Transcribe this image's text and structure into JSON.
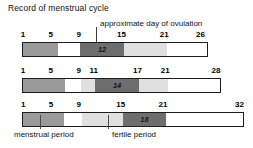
{
  "title": "Record of menstrual cycle",
  "callout": {
    "label": "approximate day of ovulation"
  },
  "legend": {
    "menstrual_label": "menstrual period",
    "fertile_label": "fertile period"
  },
  "colors": {
    "menstrual": "#9a9a9a",
    "fertile": "#6e6e6e",
    "light": "#e0e0e0",
    "white": "#ffffff",
    "outline": "#1d1d1d"
  },
  "rows": [
    {
      "cycle_length": 26,
      "ovulation_day": 12,
      "ticks": [
        {
          "label": "1",
          "pos": 0.5
        },
        {
          "label": "5",
          "pos": 15.5
        },
        {
          "label": "9",
          "pos": 30.5
        },
        {
          "label": "15",
          "pos": 53.5
        },
        {
          "label": "21",
          "pos": 76.5
        },
        {
          "label": "26",
          "pos": 96.0
        }
      ],
      "segments": [
        {
          "name": "menstrual",
          "start": 0.0,
          "end": 19.0
        },
        {
          "name": "white",
          "start": 19.0,
          "end": 31.0
        },
        {
          "name": "fertile",
          "start": 31.0,
          "end": 55.0
        },
        {
          "name": "light",
          "start": 55.0,
          "end": 78.0
        },
        {
          "name": "white",
          "start": 78.0,
          "end": 100.0
        }
      ]
    },
    {
      "cycle_length": 28,
      "ovulation_day": 14,
      "ticks": [
        {
          "label": "1",
          "pos": 0.5
        },
        {
          "label": "5",
          "pos": 14.5
        },
        {
          "label": "9",
          "pos": 28.5
        },
        {
          "label": "11",
          "pos": 36.0
        },
        {
          "label": "17",
          "pos": 58.0
        },
        {
          "label": "21",
          "pos": 72.0
        },
        {
          "label": "28",
          "pos": 97.5
        }
      ],
      "segments": [
        {
          "name": "menstrual",
          "start": 0.0,
          "end": 21.5
        },
        {
          "name": "white",
          "start": 21.5,
          "end": 29.5
        },
        {
          "name": "light",
          "start": 29.5,
          "end": 36.5
        },
        {
          "name": "fertile",
          "start": 36.5,
          "end": 59.0
        },
        {
          "name": "light",
          "start": 59.0,
          "end": 73.5
        },
        {
          "name": "white",
          "start": 73.5,
          "end": 100.0
        }
      ]
    },
    {
      "cycle_length": 32,
      "ovulation_day": 18,
      "ticks": [
        {
          "label": "1",
          "pos": 0.5
        },
        {
          "label": "5",
          "pos": 13.0
        },
        {
          "label": "9",
          "pos": 25.5
        },
        {
          "label": "15",
          "pos": 44.5
        },
        {
          "label": "21",
          "pos": 63.5
        },
        {
          "label": "32",
          "pos": 98.0
        }
      ],
      "segments": [
        {
          "name": "menstrual",
          "start": 0.0,
          "end": 18.5
        },
        {
          "name": "white",
          "start": 18.5,
          "end": 27.0
        },
        {
          "name": "light",
          "start": 27.0,
          "end": 45.5
        },
        {
          "name": "fertile",
          "start": 45.5,
          "end": 65.0
        },
        {
          "name": "white",
          "start": 65.0,
          "end": 100.0
        }
      ]
    }
  ],
  "chart_data": {
    "type": "bar",
    "title": "Record of menstrual cycle",
    "xlabel": "day of cycle",
    "ylabel": "",
    "series": [
      {
        "name": "Cycle 1 (26 days)",
        "cycle_length": 26,
        "ovulation_day": 12,
        "menstrual_period_days": [
          1,
          5
        ],
        "fertile_period_days": [
          9,
          15
        ],
        "tick_labels": [
          1,
          5,
          9,
          15,
          21,
          26
        ]
      },
      {
        "name": "Cycle 2 (28 days)",
        "cycle_length": 28,
        "ovulation_day": 14,
        "menstrual_period_days": [
          1,
          6
        ],
        "fertile_period_days": [
          11,
          17
        ],
        "tick_labels": [
          1,
          5,
          9,
          11,
          17,
          21,
          28
        ]
      },
      {
        "name": "Cycle 3 (32 days)",
        "cycle_length": 32,
        "ovulation_day": 18,
        "menstrual_period_days": [
          1,
          6
        ],
        "fertile_period_days": [
          15,
          21
        ],
        "tick_labels": [
          1,
          5,
          9,
          15,
          21,
          32
        ]
      }
    ],
    "legend": [
      "menstrual period",
      "fertile period",
      "approximate day of ovulation"
    ],
    "grid": false,
    "legend_position": "bottom"
  }
}
